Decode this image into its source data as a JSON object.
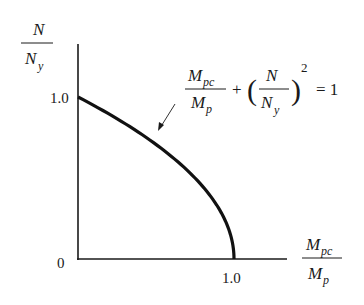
{
  "diagram": {
    "y_axis_label": {
      "numerator": "N",
      "denominator": "N",
      "denominator_sub": "y"
    },
    "x_axis_label": {
      "numerator": "M",
      "numerator_sub": "pc",
      "denominator": "M",
      "denominator_sub": "p"
    },
    "y_tick": "1.0",
    "x_tick": "1.0",
    "origin": "0",
    "equation": {
      "frac1_num": "M",
      "frac1_num_sub": "pc",
      "frac1_den": "M",
      "frac1_den_sub": "p",
      "plus": "+",
      "frac2_num": "N",
      "frac2_den": "N",
      "frac2_den_sub": "y",
      "exponent": "2",
      "equals": "= 1"
    }
  },
  "chart_data": {
    "type": "line",
    "title": "",
    "xlabel": "M_pc / M_p",
    "ylabel": "N / N_y",
    "xlim": [
      0,
      1.2
    ],
    "ylim": [
      0,
      1.1
    ],
    "x_ticks": [
      "0",
      "1.0"
    ],
    "y_ticks": [
      "0",
      "1.0"
    ],
    "series": [
      {
        "name": "M_pc/M_p + (N/N_y)^2 = 1",
        "x": [
          1.0,
          0.99,
          0.96,
          0.91,
          0.84,
          0.75,
          0.64,
          0.51,
          0.36,
          0.19,
          0.0
        ],
        "y": [
          0.0,
          0.1,
          0.2,
          0.3,
          0.4,
          0.5,
          0.6,
          0.7,
          0.8,
          0.9,
          1.0
        ]
      }
    ],
    "annotations": [
      "M_pc/M_p + (N/N_y)^2 = 1"
    ],
    "grid": false
  }
}
